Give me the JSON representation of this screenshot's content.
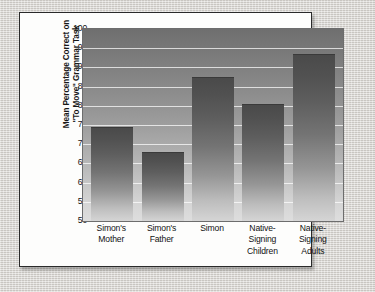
{
  "chart_data": {
    "type": "bar",
    "title": "",
    "subtitle": "",
    "xlabel": "",
    "ylabel_line1": "Mean Percentage Correct on",
    "ylabel_line2": "\"To Move\" Grammar Task",
    "categories": [
      [
        "Simon's",
        "Mother"
      ],
      [
        "Simon's",
        "Father"
      ],
      [
        "Simon"
      ],
      [
        "Native-",
        "Signing",
        "Children"
      ],
      [
        "Native-",
        "Signing",
        "Adults"
      ]
    ],
    "category_labels": [
      "Simon's Mother",
      "Simon's Father",
      "Simon",
      "Native-Signing Children",
      "Native-Signing Adults"
    ],
    "values": [
      74.5,
      68,
      87.5,
      80.5,
      93.5
    ],
    "ylim": [
      50,
      100
    ],
    "ytick_step": 5,
    "yticks": [
      100,
      95,
      90,
      85,
      80,
      75,
      70,
      65,
      60,
      55,
      50
    ],
    "grid": true,
    "legend": "none",
    "colors": {
      "bar_top": "#4a4a4a",
      "bar_bottom": "#d5d5d5",
      "plot_top": "#6f6f6f",
      "plot_bottom": "#dedede",
      "gridline": "#ffffff",
      "card_background": "#fdfdfc",
      "card_border": "#2a2a2a",
      "page_background": "#d6d3ce",
      "text": "#141414"
    }
  }
}
